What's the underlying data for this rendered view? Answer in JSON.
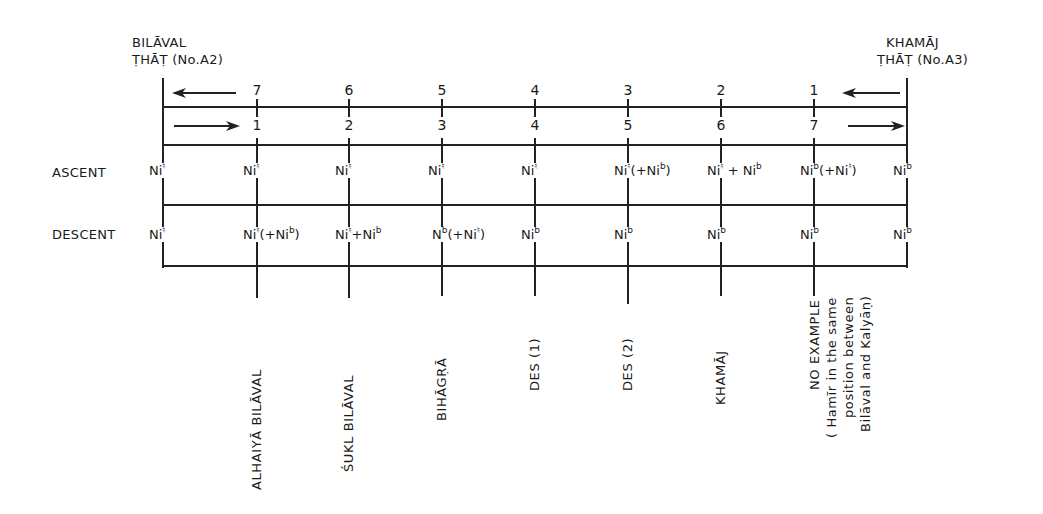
{
  "left_that": {
    "line1": "BILĀVAL",
    "line2": "ṬHĀṬ (No.A2)"
  },
  "right_that": {
    "line1": "KHAMĀJ",
    "line2": "ṬHĀṬ (No.A3)"
  },
  "top_numbers": [
    "7",
    "6",
    "5",
    "4",
    "3",
    "2",
    "1"
  ],
  "bottom_numbers": [
    "1",
    "2",
    "3",
    "4",
    "5",
    "6",
    "7"
  ],
  "row_labels": {
    "ascent": "ASCENT",
    "descent": "DESCENT"
  },
  "ascent": [
    {
      "base": "Ni",
      "sup": "♮",
      "rest": ""
    },
    {
      "base": "Ni",
      "sup": "♮",
      "rest": ""
    },
    {
      "base": "Ni",
      "sup": "♮",
      "rest": ""
    },
    {
      "base": "Ni",
      "sup": "♮",
      "rest": ""
    },
    {
      "base": "Ni",
      "sup": "♮",
      "rest": ""
    },
    {
      "base": "Ni",
      "sup": "♮",
      "rest": "(+Ni",
      "rest_sup": "b",
      "tail": ")"
    },
    {
      "base": "Ni",
      "sup": "♮",
      "rest": " + Ni",
      "rest_sup": "b",
      "tail": ""
    },
    {
      "base": "Ni",
      "sup": "b",
      "rest": "(+Ni",
      "rest_sup": "♮",
      "tail": ")"
    },
    {
      "base": "Ni",
      "sup": "b",
      "rest": ""
    }
  ],
  "descent": [
    {
      "base": "Ni",
      "sup": "♮",
      "rest": ""
    },
    {
      "base": "Ni",
      "sup": "♮",
      "rest": "(+Ni",
      "rest_sup": "b",
      "tail": ")"
    },
    {
      "base": "Ni",
      "sup": "♮",
      "rest": "+Ni",
      "rest_sup": "b",
      "tail": ""
    },
    {
      "base": "N",
      "sup": "b",
      "rest": "(+Ni",
      "rest_sup": "♮",
      "tail": ")"
    },
    {
      "base": "Ni",
      "sup": "b",
      "rest": ""
    },
    {
      "base": "Ni",
      "sup": "b",
      "rest": ""
    },
    {
      "base": "Ni",
      "sup": "b",
      "rest": ""
    },
    {
      "base": "Ni",
      "sup": "b",
      "rest": ""
    },
    {
      "base": "Ni",
      "sup": "b",
      "rest": ""
    }
  ],
  "ragas": [
    {
      "lines": [
        "ALHAIYĀ  BILĀVAL"
      ]
    },
    {
      "lines": [
        "ŚUKL   BILĀVAL"
      ]
    },
    {
      "lines": [
        "BIHĀGṚĀ"
      ]
    },
    {
      "lines": [
        "DES (1)"
      ]
    },
    {
      "lines": [
        "DES (2)"
      ]
    },
    {
      "lines": [
        "KHAMĀJ"
      ]
    },
    {
      "lines": [
        "NO EXAMPLE",
        "( Hamīr in the same",
        "position between",
        "Bilāval and  Kalyāṇ)"
      ]
    }
  ]
}
